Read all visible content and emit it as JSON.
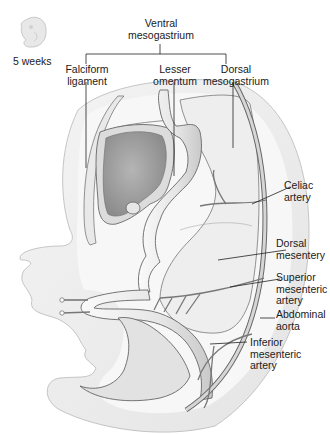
{
  "figure": {
    "stage_label": "5 weeks",
    "stage_icon": "embryo-icon",
    "colors": {
      "tissue_fill": "#ececec",
      "tissue_light": "#f5f5f5",
      "liver_fill": "#9a9a9a",
      "outline": "#555555",
      "vessel": "#8a8a8a",
      "leader_line": "#222222"
    }
  },
  "labels": {
    "ventral_mesogastrium": {
      "line1": "Ventral",
      "line2": "mesogastrium"
    },
    "falciform_ligament": {
      "line1": "Falciform",
      "line2": "ligament"
    },
    "lesser_omentum": {
      "line1": "Lesser",
      "line2": "omentum"
    },
    "dorsal_mesogastrium": {
      "line1": "Dorsal",
      "line2": "mesogastrium"
    },
    "celiac_artery": {
      "line1": "Celiac",
      "line2": "artery"
    },
    "dorsal_mesentery": {
      "line1": "Dorsal",
      "line2": "mesentery"
    },
    "superior_mesenteric_artery": {
      "line1": "Superior",
      "line2": "mesenteric",
      "line3": "artery"
    },
    "abdominal_aorta": {
      "line1": "Abdominal",
      "line2": "aorta"
    },
    "inferior_mesenteric_artery": {
      "line1": "Inferior",
      "line2": "mesenteric",
      "line3": "artery"
    }
  }
}
